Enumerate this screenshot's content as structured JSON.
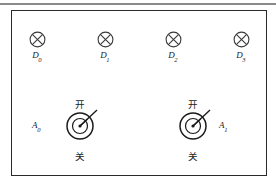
{
  "diagram": {
    "frame": {
      "border_color": "#2a2a2a",
      "background": "#ffffff",
      "top_rule_color": "#8a8a8a"
    },
    "lamps": [
      {
        "icon": "lamp-cross-circle-icon",
        "label_base": "D",
        "label_sub": "0",
        "x": 19,
        "y": 30
      },
      {
        "icon": "lamp-cross-circle-icon",
        "label_base": "D",
        "label_sub": "1",
        "x": 87,
        "y": 30
      },
      {
        "icon": "lamp-cross-circle-icon",
        "label_base": "D",
        "label_sub": "2",
        "x": 155,
        "y": 30
      },
      {
        "icon": "lamp-cross-circle-icon",
        "label_base": "D",
        "label_sub": "3",
        "x": 223,
        "y": 30
      }
    ],
    "switches": [
      {
        "icon": "rotary-knob-icon",
        "on_label": "开",
        "off_label": "关",
        "name_base": "A",
        "name_sub": "0",
        "name_side": "left",
        "x": 29,
        "y": 98
      },
      {
        "icon": "rotary-knob-icon",
        "on_label": "开",
        "off_label": "关",
        "name_base": "A",
        "name_sub": "1",
        "name_side": "right",
        "x": 142,
        "y": 98
      }
    ],
    "stroke": {
      "lamp_color": "#3a3a3a",
      "knob_color": "#1a1a1a"
    }
  }
}
